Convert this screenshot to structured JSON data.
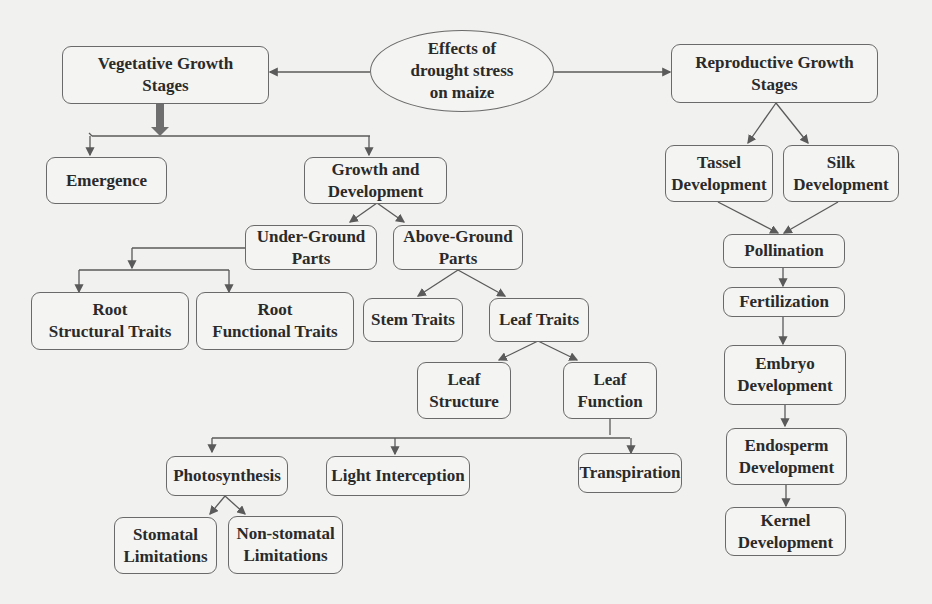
{
  "root": {
    "label": "Effects of\ndrought stress\non maize"
  },
  "vegetative": {
    "title": "Vegetative Growth\nStages",
    "emergence": "Emergence",
    "growth_dev": "Growth and\nDevelopment",
    "under_ground": "Under-Ground\nParts",
    "above_ground": "Above-Ground\nParts",
    "root_structural": "Root\nStructural Traits",
    "root_functional": "Root\nFunctional Traits",
    "stem_traits": "Stem Traits",
    "leaf_traits": "Leaf Traits",
    "leaf_structure": "Leaf\nStructure",
    "leaf_function": "Leaf\nFunction",
    "photosynthesis": "Photosynthesis",
    "light_interception": "Light Interception",
    "transpiration": "Transpiration",
    "stomatal": "Stomatal\nLimitations",
    "non_stomatal": "Non-stomatal\nLimitations"
  },
  "reproductive": {
    "title": "Reproductive Growth\nStages",
    "tassel": "Tassel\nDevelopment",
    "silk": "Silk\nDevelopment",
    "pollination": "Pollination",
    "fertilization": "Fertilization",
    "embryo": "Embryo\nDevelopment",
    "endosperm": "Endosperm\nDevelopment",
    "kernel": "Kernel\nDevelopment"
  },
  "colors": {
    "line": "#5a5a5a",
    "border": "#6a6a6a",
    "background": "#f1f1ef",
    "thick_arrow": "#6e6e6e"
  }
}
